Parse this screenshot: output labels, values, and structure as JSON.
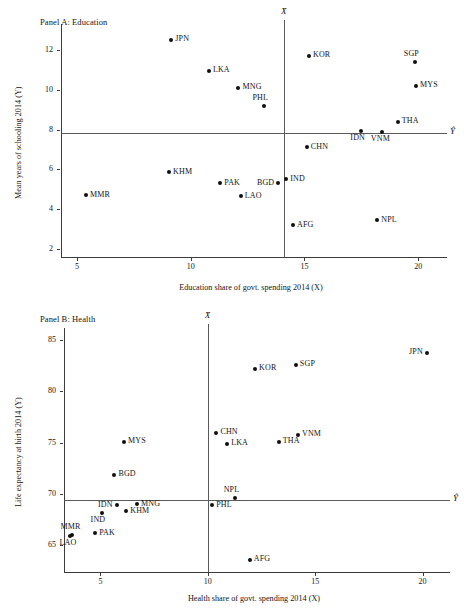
{
  "figure": {
    "marker_color": "#101010",
    "axis_color": "#3c3c3c",
    "refline_color": "#5a5a5a"
  },
  "panels": [
    {
      "id": "panel-a",
      "title": "Panel A: Education",
      "xmark": "X̄",
      "ymark": "Ŷ"
    },
    {
      "id": "panel-b",
      "title": "Panel B: Health",
      "xmark": "X̄",
      "ymark": "Ŷ"
    }
  ],
  "chart_data": [
    {
      "type": "scatter",
      "title": "Panel A: Education",
      "xlabel": "Education share of govt. spending 2014 (X)",
      "ylabel": "Mean years of schooling 2014 (Y)",
      "xlim": [
        4.3,
        21.0
      ],
      "ylim": [
        1.6,
        13.1
      ],
      "xticks": [
        5,
        10,
        15,
        20
      ],
      "yticks": [
        2,
        4,
        6,
        8,
        10,
        12
      ],
      "xticklabels": [
        "5",
        "10",
        "15",
        "20"
      ],
      "yticklabels": [
        "2",
        "4",
        "6",
        "8",
        "10",
        "12"
      ],
      "grid": false,
      "legend": "none",
      "reference_lines": {
        "x_mean": 14.1,
        "y_mean": 7.85,
        "x_mean_label": "X̄",
        "y_mean_label": "Ŷ"
      },
      "points": [
        {
          "label": "JPN",
          "x": 9.15,
          "y": 12.5,
          "labelpos": "right"
        },
        {
          "label": "LKA",
          "x": 10.8,
          "y": 10.95,
          "labelpos": "right"
        },
        {
          "label": "MNG",
          "x": 12.1,
          "y": 10.1,
          "labelpos": "right"
        },
        {
          "label": "PHL",
          "x": 13.2,
          "y": 9.2,
          "labelpos": "above"
        },
        {
          "label": "KOR",
          "x": 15.2,
          "y": 11.7,
          "labelpos": "right"
        },
        {
          "label": "SGP",
          "x": 19.85,
          "y": 11.4,
          "labelpos": "above"
        },
        {
          "label": "MYS",
          "x": 19.9,
          "y": 10.2,
          "labelpos": "right"
        },
        {
          "label": "THA",
          "x": 19.1,
          "y": 8.4,
          "labelpos": "right"
        },
        {
          "label": "IDN",
          "x": 17.5,
          "y": 7.95,
          "labelpos": "below"
        },
        {
          "label": "VNM",
          "x": 18.4,
          "y": 7.9,
          "labelpos": "below"
        },
        {
          "label": "CHN",
          "x": 15.1,
          "y": 7.1,
          "labelpos": "right"
        },
        {
          "label": "KHM",
          "x": 9.05,
          "y": 5.85,
          "labelpos": "right"
        },
        {
          "label": "PAK",
          "x": 11.3,
          "y": 5.3,
          "labelpos": "right"
        },
        {
          "label": "LAO",
          "x": 12.2,
          "y": 4.65,
          "labelpos": "right"
        },
        {
          "label": "BGD",
          "x": 13.85,
          "y": 5.3,
          "labelpos": "left"
        },
        {
          "label": "IND",
          "x": 14.2,
          "y": 5.5,
          "labelpos": "right"
        },
        {
          "label": "MMR",
          "x": 5.4,
          "y": 4.7,
          "labelpos": "right"
        },
        {
          "label": "AFG",
          "x": 14.5,
          "y": 3.2,
          "labelpos": "right"
        },
        {
          "label": "NPL",
          "x": 18.2,
          "y": 3.45,
          "labelpos": "right"
        }
      ]
    },
    {
      "type": "scatter",
      "title": "Panel B: Health",
      "xlabel": "Health share of govt. spending 2014 (X)",
      "ylabel": "Life expectancy at birth 2014 (Y)",
      "xlim": [
        3.3,
        21.0
      ],
      "ylim": [
        62.4,
        85.8
      ],
      "xticks": [
        5,
        10,
        15,
        20
      ],
      "yticks": [
        65,
        70,
        75,
        80,
        85
      ],
      "xticklabels": [
        "5",
        "10",
        "15",
        "20"
      ],
      "yticklabels": [
        "65",
        "70",
        "75",
        "80",
        "85"
      ],
      "grid": false,
      "legend": "none",
      "reference_lines": {
        "x_mean": 10.0,
        "y_mean": 69.4,
        "x_mean_label": "X̄",
        "y_mean_label": "Ŷ"
      },
      "points": [
        {
          "label": "JPN",
          "x": 20.2,
          "y": 83.8,
          "labelpos": "left"
        },
        {
          "label": "KOR",
          "x": 12.2,
          "y": 82.2,
          "labelpos": "right"
        },
        {
          "label": "SGP",
          "x": 14.1,
          "y": 82.6,
          "labelpos": "right"
        },
        {
          "label": "CHN",
          "x": 10.4,
          "y": 76.0,
          "labelpos": "right"
        },
        {
          "label": "VNM",
          "x": 14.2,
          "y": 75.8,
          "labelpos": "right"
        },
        {
          "label": "LKA",
          "x": 10.9,
          "y": 74.9,
          "labelpos": "right"
        },
        {
          "label": "THA",
          "x": 13.3,
          "y": 75.1,
          "labelpos": "right"
        },
        {
          "label": "MYS",
          "x": 6.1,
          "y": 75.1,
          "labelpos": "right"
        },
        {
          "label": "BGD",
          "x": 5.65,
          "y": 71.9,
          "labelpos": "right"
        },
        {
          "label": "NPL",
          "x": 11.25,
          "y": 69.6,
          "labelpos": "above"
        },
        {
          "label": "MNG",
          "x": 6.7,
          "y": 69.0,
          "labelpos": "right"
        },
        {
          "label": "IDN",
          "x": 5.75,
          "y": 68.9,
          "labelpos": "left"
        },
        {
          "label": "PHL",
          "x": 10.2,
          "y": 68.9,
          "labelpos": "right"
        },
        {
          "label": "KHM",
          "x": 6.2,
          "y": 68.3,
          "labelpos": "right"
        },
        {
          "label": "IND",
          "x": 5.05,
          "y": 68.2,
          "labelpos": "below"
        },
        {
          "label": "PAK",
          "x": 4.75,
          "y": 66.2,
          "labelpos": "right"
        },
        {
          "label": "MMR",
          "x": 3.65,
          "y": 66.0,
          "labelpos": "above"
        },
        {
          "label": "LAO",
          "x": 3.6,
          "y": 65.9,
          "labelpos": "below"
        },
        {
          "label": "AFG",
          "x": 11.95,
          "y": 63.6,
          "labelpos": "right"
        }
      ]
    }
  ]
}
